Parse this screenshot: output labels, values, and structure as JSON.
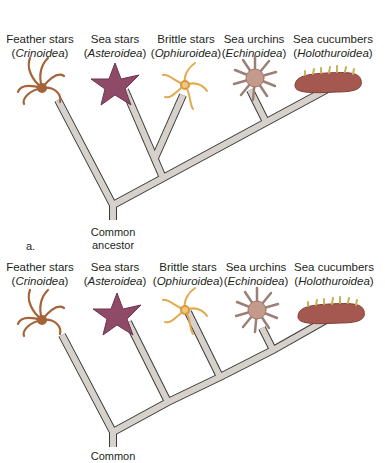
{
  "figure": {
    "panels": [
      {
        "id": "a",
        "letter": "a.",
        "ancestor_label_line1": "Common",
        "ancestor_label_line2": "ancestor",
        "taxa": [
          {
            "common": "Feather stars",
            "scientific": "Crinoidea"
          },
          {
            "common": "Sea stars",
            "scientific": "Asteroidea"
          },
          {
            "common": "Brittle stars",
            "scientific": "Ophiuroidea"
          },
          {
            "common": "Sea urchins",
            "scientific": "Echinoidea"
          },
          {
            "common": "Sea cucumbers",
            "scientific": "Holothuroidea"
          }
        ],
        "topology": "(Crinoidea, ((Asteroidea, Ophiuroidea), (Echinoidea, Holothuroidea)))"
      },
      {
        "id": "b",
        "letter": "",
        "ancestor_label_line1": "Common",
        "ancestor_label_line2": "",
        "taxa": [
          {
            "common": "Feather stars",
            "scientific": "Crinoidea"
          },
          {
            "common": "Sea stars",
            "scientific": "Asteroidea"
          },
          {
            "common": "Brittle stars",
            "scientific": "Ophiuroidea"
          },
          {
            "common": "Sea urchins",
            "scientific": "Echinoidea"
          },
          {
            "common": "Sea cucumbers",
            "scientific": "Holothuroidea"
          }
        ],
        "topology": "(Crinoidea, (Asteroidea, (Ophiuroidea, (Echinoidea, Holothuroidea))))"
      }
    ],
    "colors": {
      "branch_fill": "#d6d2cb",
      "branch_outline": "#3a3a3a",
      "feather_star": "#a5633a",
      "sea_star": "#8e4a66",
      "brittle_star": "#e3a94f",
      "sea_urchin": "#b58a7e",
      "sea_cucumber": "#a5584f",
      "sea_cucumber_papillae": "#c9b155"
    }
  }
}
